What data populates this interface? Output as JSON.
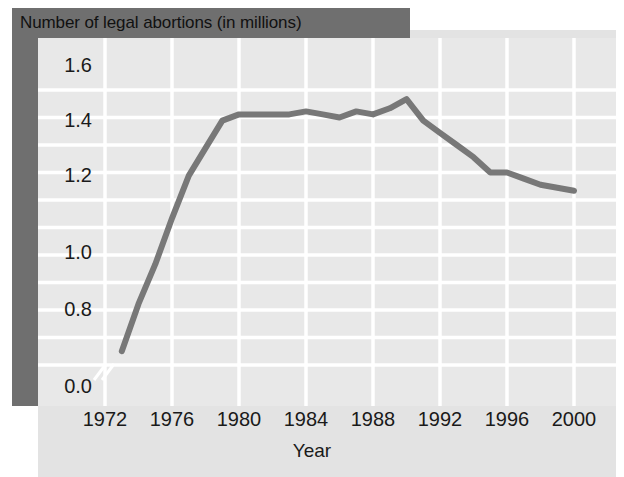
{
  "figure": {
    "title": "Number of legal abortions (in millions)",
    "axis_title_x": "Year",
    "colors": {
      "title_band": "#6f6f6f",
      "left_band": "#6f6f6f",
      "plot_background": "#e8e8e8",
      "page_background": "#e3e3e3",
      "gridline": "#ffffff",
      "line": "#787878",
      "text": "#1a1a1a"
    }
  },
  "y_ticks": [
    "1.6",
    "1.4",
    "1.2",
    "1.0",
    "0.8",
    "0.0"
  ],
  "x_ticks": [
    "1972",
    "1976",
    "1980",
    "1984",
    "1988",
    "1992",
    "1996",
    "2000"
  ],
  "chart_data": {
    "type": "line",
    "title": "Number of legal abortions (in millions)",
    "xlabel": "Year",
    "ylabel": "",
    "xlim": [
      1972,
      2000
    ],
    "ylim": [
      0.7,
      1.65
    ],
    "y_axis_break": true,
    "y_axis_break_between": [
      0.0,
      0.7
    ],
    "grid": true,
    "legend": "none",
    "x_tick_labels": [
      "1972",
      "1976",
      "1980",
      "1984",
      "1988",
      "1992",
      "1996",
      "2000"
    ],
    "y_tick_labels": [
      "0.0",
      "0.8",
      "1.0",
      "1.2",
      "1.4",
      "1.6"
    ],
    "series": [
      {
        "name": "Number of legal abortions (in millions)",
        "units": "millions",
        "x": [
          1973,
          1974,
          1975,
          1976,
          1977,
          1978,
          1979,
          1980,
          1981,
          1982,
          1983,
          1984,
          1985,
          1986,
          1987,
          1988,
          1989,
          1990,
          1991,
          1992,
          1993,
          1994,
          1995,
          1996,
          1997,
          1998,
          1999,
          2000
        ],
        "values": [
          0.745,
          0.9,
          1.03,
          1.18,
          1.32,
          1.41,
          1.5,
          1.52,
          1.52,
          1.52,
          1.52,
          1.53,
          1.52,
          1.51,
          1.53,
          1.52,
          1.54,
          1.57,
          1.5,
          1.46,
          1.42,
          1.38,
          1.33,
          1.33,
          1.31,
          1.29,
          1.28,
          1.27
        ]
      }
    ]
  }
}
